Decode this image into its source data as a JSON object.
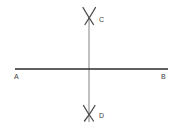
{
  "diagram": {
    "background_color": "#ffffff",
    "labels": {
      "a": "A",
      "b": "B",
      "c": "C",
      "d": "D"
    },
    "label_color": "#3a3a3a",
    "lines": [
      {
        "name": "line-ab",
        "orientation": "horizontal",
        "x1": 15,
        "y1": 69,
        "x2": 168,
        "y2": 69,
        "color": "#2b2b2b",
        "width": 1.6
      },
      {
        "name": "line-cd",
        "orientation": "vertical",
        "x1": 89,
        "y1": 18,
        "x2": 89,
        "y2": 122,
        "color": "#8c8c8c",
        "width": 1.1
      }
    ],
    "arc_marks": [
      {
        "name": "arc-mark-c",
        "position": "top",
        "center_x": 89,
        "center_y": 16,
        "color": "#4a4a4a",
        "width": 1.3
      },
      {
        "name": "arc-mark-d",
        "position": "bottom",
        "center_x": 89,
        "center_y": 113,
        "color": "#4a4a4a",
        "width": 1.3
      }
    ],
    "intersection": {
      "x": 89,
      "y": 69
    }
  }
}
